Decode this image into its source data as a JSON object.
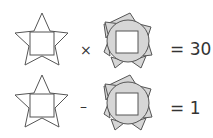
{
  "puzzle": {
    "rows": [
      {
        "operator": "×",
        "equals": "= 30"
      },
      {
        "operator": "–",
        "equals": "= 1"
      }
    ],
    "shapes": {
      "shape_a": "star-with-square",
      "shape_b": "sun-with-circle-and-square"
    },
    "colors": {
      "stroke": "#555555",
      "fill_b": "#d6d6d6",
      "background": "#ffffff"
    }
  }
}
